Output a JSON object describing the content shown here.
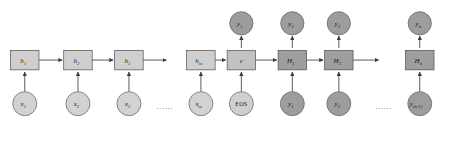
{
  "figure": {
    "type": "diagram",
    "top_clipped_text": "",
    "colors": {
      "encoder_hidden_fill": "#cfcfcf",
      "context_fill": "#c2c2c2",
      "decoder_hidden_fill": "#9e9e9e",
      "input_circle_fill": "#d2d2d2",
      "eos_circle_fill": "#cfcfcf",
      "output_circle_fill": "#9d9d9d",
      "decoder_input_circle_fill": "#9d9d9d",
      "stroke": "#4a4a4a",
      "edge": "#3c3c3c",
      "background": "#ffffff"
    },
    "ellipsis_glyph": "......"
  },
  "encoder": {
    "hidden_states": [
      {
        "name": "h1",
        "label": "h",
        "subscript": "1",
        "x": 33,
        "y": 80
      },
      {
        "name": "h2",
        "label": "h",
        "subscript": "2",
        "x": 104,
        "y": 80
      },
      {
        "name": "h3",
        "label": "h",
        "subscript": "3",
        "x": 172,
        "y": 80
      },
      {
        "name": "hm",
        "label": "h",
        "subscript": "m",
        "x": 268,
        "y": 80
      }
    ],
    "inputs": [
      {
        "name": "x1",
        "label": "x",
        "subscript": "1",
        "x": 33,
        "y": 138
      },
      {
        "name": "x2",
        "label": "x",
        "subscript": "2",
        "x": 104,
        "y": 138
      },
      {
        "name": "x3",
        "label": "x",
        "subscript": "3",
        "x": 172,
        "y": 138
      },
      {
        "name": "xm",
        "label": "x",
        "subscript": "m",
        "x": 268,
        "y": 138
      }
    ],
    "input_ellipsis_x": 220,
    "input_ellipsis_y": 140
  },
  "context": {
    "name": "c",
    "label": "c",
    "subscript": "",
    "x": 322,
    "y": 80
  },
  "decoder": {
    "hidden_states": [
      {
        "name": "H1",
        "label": "H",
        "subscript": "1",
        "x": 390,
        "y": 80
      },
      {
        "name": "H2",
        "label": "H",
        "subscript": "2",
        "x": 452,
        "y": 80
      },
      {
        "name": "Hn",
        "label": "H",
        "subscript": "n",
        "x": 560,
        "y": 80
      }
    ],
    "inputs": [
      {
        "name": "EOS",
        "label": "EOS",
        "subscript": "",
        "upright": true,
        "x": 322,
        "y": 138
      },
      {
        "name": "y1-in",
        "label": "y",
        "subscript": "1",
        "x": 390,
        "y": 138
      },
      {
        "name": "y2-in",
        "label": "y",
        "subscript": "2",
        "x": 452,
        "y": 138
      },
      {
        "name": "yn-1-in",
        "label": "y",
        "subscript": "(n-1)",
        "x": 560,
        "y": 138
      }
    ],
    "outputs": [
      {
        "name": "y1-out",
        "label": "y",
        "subscript": "1",
        "x": 322,
        "y": 31
      },
      {
        "name": "y2-out",
        "label": "y",
        "subscript": "2",
        "x": 390,
        "y": 31
      },
      {
        "name": "y3-out",
        "label": "y",
        "subscript": "3",
        "x": 452,
        "y": 31
      },
      {
        "name": "yn-out",
        "label": "y",
        "subscript": "n",
        "x": 560,
        "y": 31
      }
    ],
    "input_ellipsis_x": 512,
    "input_ellipsis_y": 140
  },
  "geometry": {
    "box_width": 38,
    "box_height": 26,
    "circle_radius": 16,
    "output_circle_radius": 15.5
  }
}
